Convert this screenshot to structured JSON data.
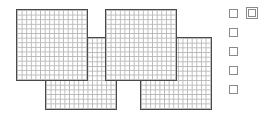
{
  "canvas": {
    "width": 273,
    "height": 118,
    "background": "#ffffff"
  },
  "style": {
    "panel_border_color": "#4a4a4a",
    "panel_grid_line_color": "#b9b9b9",
    "panel_fill_color": "#ffffff",
    "checkbox_border_color": "#8a8a8a",
    "checkbox_fill_color": "#ffffff"
  },
  "diagram": {
    "panel_count": 4,
    "checkbox_count": 6,
    "grid_cells_per_side": 15
  },
  "panels": [
    {
      "name": "grid-panel-top-left",
      "label": "1",
      "x": 16,
      "y": 9,
      "width": 72,
      "height": 72,
      "rows": 15,
      "cols": 15,
      "z": 4
    },
    {
      "name": "grid-panel-top-right",
      "label": "2",
      "x": 105,
      "y": 9,
      "width": 72,
      "height": 72,
      "rows": 15,
      "cols": 15,
      "z": 3
    },
    {
      "name": "grid-panel-bottom-left",
      "label": "3",
      "x": 45,
      "y": 37,
      "width": 72,
      "height": 73,
      "rows": 15,
      "cols": 15,
      "z": 2
    },
    {
      "name": "grid-panel-bottom-right",
      "label": "4",
      "x": 140,
      "y": 37,
      "width": 72,
      "height": 73,
      "rows": 15,
      "cols": 15,
      "z": 1
    }
  ],
  "checkboxes": [
    {
      "name": "checkbox-1",
      "x": 229,
      "y": 9,
      "size": 9,
      "checked": false,
      "highlighted": false
    },
    {
      "name": "checkbox-2",
      "x": 246,
      "y": 7,
      "size": 12,
      "checked": false,
      "highlighted": true
    },
    {
      "name": "checkbox-3",
      "x": 229,
      "y": 28,
      "size": 9,
      "checked": false,
      "highlighted": false
    },
    {
      "name": "checkbox-4",
      "x": 229,
      "y": 47,
      "size": 9,
      "checked": false,
      "highlighted": false
    },
    {
      "name": "checkbox-5",
      "x": 229,
      "y": 66,
      "size": 9,
      "checked": false,
      "highlighted": false
    },
    {
      "name": "checkbox-6",
      "x": 229,
      "y": 85,
      "size": 9,
      "checked": false,
      "highlighted": false
    }
  ]
}
